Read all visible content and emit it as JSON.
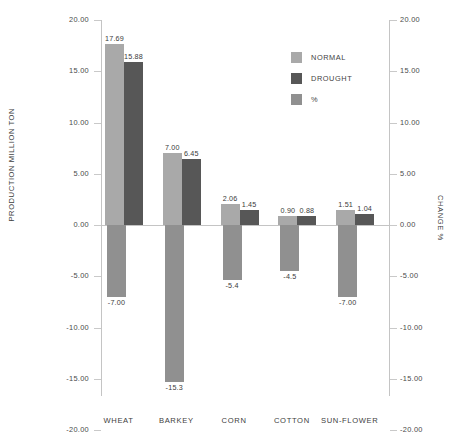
{
  "chart_data": {
    "type": "bar",
    "title": "",
    "subtitle": "",
    "xlabel": "",
    "ylabel": "PRODUCTION MILLION TON",
    "y2label": "CHANGE  %",
    "categories": [
      "WHEAT",
      "BARKEY",
      "CORN",
      "COTTON",
      "SUN-FLOWER"
    ],
    "series": [
      {
        "name": "NORMAL",
        "axis": "left",
        "color": "#a9a9a9",
        "values": [
          17.69,
          7.0,
          2.06,
          0.9,
          1.51
        ],
        "labels": [
          "17.69",
          "7.00",
          "2.06",
          "0.90",
          "1.51"
        ]
      },
      {
        "name": "DROUGHT",
        "axis": "left",
        "color": "#575757",
        "values": [
          15.88,
          6.45,
          1.45,
          0.88,
          1.04
        ],
        "labels": [
          "15.88",
          "6.45",
          "1.45",
          "0.88",
          "1.04"
        ]
      },
      {
        "name": "%",
        "axis": "right",
        "color": "#909090",
        "values": [
          -7.0,
          -15.3,
          -5.4,
          -4.5,
          -7.0
        ],
        "labels": [
          "-7.00",
          "-15.3",
          "-5.4",
          "-4.5",
          "-7.00"
        ]
      }
    ],
    "ylim": [
      -20,
      20
    ],
    "y2lim": [
      -20,
      20
    ],
    "yticks": [
      "20.00",
      "15.00",
      "10.00",
      "5.00",
      "0.00",
      "-5.00",
      "-10.00",
      "-15.00",
      "-20.00"
    ],
    "ytick_values": [
      20,
      15,
      10,
      5,
      0,
      -5,
      -10,
      -15,
      -20
    ],
    "y2ticks": [
      "20.00",
      "15.00",
      "10.00",
      "5.00",
      "0.00",
      "-5.00",
      "-10.00",
      "-15.00",
      "-20.00"
    ],
    "y2tick_values": [
      20,
      15,
      10,
      5,
      0,
      -5,
      -10,
      -15,
      -20
    ],
    "grid": false,
    "legend_position": "top-right",
    "legend": [
      "NORMAL",
      "DROUGHT",
      "%"
    ]
  },
  "legend": {
    "items": [
      {
        "label": "NORMAL",
        "swatch": "legend-swatch-normal"
      },
      {
        "label": "DROUGHT",
        "swatch": "legend-swatch-drought"
      },
      {
        "label": "%",
        "swatch": "legend-swatch-percent"
      }
    ]
  },
  "axes": {
    "left_title": "PRODUCTION MILLION TON",
    "right_title": "CHANGE  %"
  }
}
